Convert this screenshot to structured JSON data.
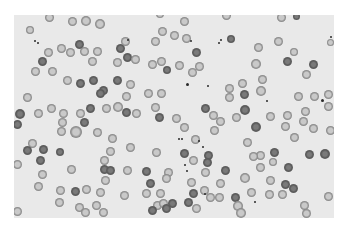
{
  "image": {
    "description": "Peripheral blood smear micrograph showing scattered red blood cells (erythrocytes) with central pallor, a few darker spherocyte-like cells and small dark platelet clumps",
    "background_color": "#ffffff",
    "smear_color": "#e9e9e9",
    "cell_ring_color": "#7d7d7d",
    "cell_center_color": "#c9c9c9",
    "dark_cell_color": "#5a5a5a"
  },
  "cells": [
    [
      49,
      17,
      9,
      0
    ],
    [
      72,
      21,
      9,
      0
    ],
    [
      86,
      21,
      10,
      0
    ],
    [
      100,
      24,
      10,
      0
    ],
    [
      160,
      14,
      8,
      0
    ],
    [
      184,
      21,
      9,
      0
    ],
    [
      226,
      15,
      9,
      0
    ],
    [
      281,
      17,
      9,
      0
    ],
    [
      296,
      16,
      7,
      1
    ],
    [
      30,
      30,
      8,
      0
    ],
    [
      162,
      31,
      9,
      0
    ],
    [
      174,
      35,
      9,
      0
    ],
    [
      186,
      38,
      9,
      0
    ],
    [
      231,
      39,
      8,
      1
    ],
    [
      278,
      41,
      9,
      0
    ],
    [
      330,
      42,
      7,
      0
    ],
    [
      48,
      52,
      9,
      0
    ],
    [
      61,
      48,
      9,
      0
    ],
    [
      70,
      52,
      9,
      0
    ],
    [
      79,
      44,
      9,
      1
    ],
    [
      84,
      51,
      9,
      0
    ],
    [
      97,
      51,
      9,
      0
    ],
    [
      120,
      48,
      9,
      1
    ],
    [
      125,
      41,
      9,
      0
    ],
    [
      155,
      41,
      9,
      0
    ],
    [
      196,
      52,
      9,
      1
    ],
    [
      258,
      47,
      9,
      0
    ],
    [
      294,
      52,
      8,
      0
    ],
    [
      42,
      61,
      9,
      1
    ],
    [
      92,
      61,
      9,
      0
    ],
    [
      117,
      62,
      9,
      0
    ],
    [
      127,
      57,
      9,
      1
    ],
    [
      135,
      59,
      9,
      0
    ],
    [
      152,
      64,
      9,
      0
    ],
    [
      161,
      61,
      9,
      0
    ],
    [
      167,
      70,
      8,
      1
    ],
    [
      179,
      65,
      9,
      0
    ],
    [
      192,
      72,
      9,
      0
    ],
    [
      199,
      66,
      9,
      0
    ],
    [
      256,
      64,
      10,
      0
    ],
    [
      287,
      61,
      9,
      1
    ],
    [
      313,
      64,
      9,
      1
    ],
    [
      35,
      71,
      9,
      0
    ],
    [
      52,
      71,
      9,
      0
    ],
    [
      67,
      80,
      9,
      0
    ],
    [
      80,
      83,
      9,
      1
    ],
    [
      93,
      80,
      9,
      1
    ],
    [
      103,
      90,
      9,
      1
    ],
    [
      117,
      80,
      9,
      1
    ],
    [
      130,
      84,
      9,
      0
    ],
    [
      262,
      79,
      9,
      0
    ],
    [
      306,
      74,
      9,
      0
    ],
    [
      229,
      88,
      9,
      0
    ],
    [
      242,
      83,
      9,
      0
    ],
    [
      27,
      97,
      9,
      0
    ],
    [
      100,
      93,
      9,
      1
    ],
    [
      126,
      96,
      9,
      0
    ],
    [
      148,
      93,
      9,
      0
    ],
    [
      161,
      93,
      9,
      0
    ],
    [
      229,
      97,
      9,
      0
    ],
    [
      244,
      94,
      9,
      1
    ],
    [
      261,
      91,
      10,
      0
    ],
    [
      298,
      96,
      9,
      0
    ],
    [
      314,
      96,
      9,
      0
    ],
    [
      328,
      94,
      9,
      0
    ],
    [
      20,
      114,
      10,
      1
    ],
    [
      38,
      113,
      9,
      0
    ],
    [
      51,
      108,
      9,
      0
    ],
    [
      63,
      113,
      9,
      0
    ],
    [
      80,
      113,
      9,
      0
    ],
    [
      90,
      108,
      9,
      1
    ],
    [
      106,
      108,
      9,
      0
    ],
    [
      118,
      107,
      10,
      0
    ],
    [
      126,
      112,
      9,
      1
    ],
    [
      136,
      113,
      9,
      0
    ],
    [
      155,
      107,
      9,
      0
    ],
    [
      205,
      108,
      9,
      1
    ],
    [
      213,
      115,
      9,
      0
    ],
    [
      245,
      110,
      10,
      1
    ],
    [
      270,
      116,
      9,
      0
    ],
    [
      287,
      115,
      9,
      0
    ],
    [
      305,
      111,
      9,
      0
    ],
    [
      328,
      106,
      9,
      0
    ],
    [
      17,
      124,
      9,
      1
    ],
    [
      62,
      122,
      9,
      0
    ],
    [
      84,
      122,
      9,
      1
    ],
    [
      159,
      117,
      9,
      1
    ],
    [
      176,
      118,
      9,
      0
    ],
    [
      220,
      121,
      9,
      0
    ],
    [
      236,
      117,
      9,
      0
    ],
    [
      256,
      127,
      10,
      1
    ],
    [
      285,
      126,
      9,
      0
    ],
    [
      303,
      121,
      9,
      0
    ],
    [
      313,
      128,
      9,
      0
    ],
    [
      61,
      131,
      9,
      0
    ],
    [
      76,
      132,
      12,
      0
    ],
    [
      97,
      132,
      9,
      0
    ],
    [
      184,
      127,
      9,
      0
    ],
    [
      214,
      130,
      9,
      0
    ],
    [
      330,
      130,
      9,
      0
    ],
    [
      32,
      143,
      9,
      0
    ],
    [
      112,
      138,
      9,
      0
    ],
    [
      195,
      139,
      9,
      0
    ],
    [
      247,
      142,
      9,
      0
    ],
    [
      294,
      137,
      9,
      0
    ],
    [
      27,
      150,
      9,
      1
    ],
    [
      43,
      149,
      9,
      1
    ],
    [
      60,
      152,
      8,
      1
    ],
    [
      110,
      151,
      9,
      0
    ],
    [
      130,
      147,
      9,
      0
    ],
    [
      156,
      152,
      9,
      0
    ],
    [
      184,
      153,
      9,
      1
    ],
    [
      208,
      155,
      9,
      1
    ],
    [
      260,
      155,
      9,
      0
    ],
    [
      274,
      152,
      9,
      1
    ],
    [
      309,
      154,
      9,
      1
    ],
    [
      325,
      154,
      10,
      1
    ],
    [
      40,
      160,
      9,
      1
    ],
    [
      104,
      160,
      9,
      0
    ],
    [
      193,
      160,
      9,
      0
    ],
    [
      207,
      162,
      9,
      1
    ],
    [
      253,
      156,
      9,
      0
    ],
    [
      273,
      162,
      8,
      0
    ],
    [
      17,
      164,
      9,
      0
    ],
    [
      71,
      169,
      9,
      0
    ],
    [
      104,
      169,
      9,
      1
    ],
    [
      110,
      170,
      9,
      1
    ],
    [
      127,
      170,
      9,
      0
    ],
    [
      146,
      171,
      9,
      1
    ],
    [
      168,
      172,
      9,
      0
    ],
    [
      205,
      172,
      9,
      0
    ],
    [
      225,
      170,
      9,
      1
    ],
    [
      260,
      167,
      9,
      0
    ],
    [
      288,
      167,
      9,
      1
    ],
    [
      42,
      174,
      9,
      0
    ],
    [
      105,
      180,
      9,
      0
    ],
    [
      150,
      183,
      9,
      1
    ],
    [
      166,
      178,
      9,
      0
    ],
    [
      191,
      182,
      9,
      0
    ],
    [
      220,
      183,
      9,
      0
    ],
    [
      245,
      178,
      10,
      0
    ],
    [
      270,
      180,
      9,
      0
    ],
    [
      285,
      184,
      9,
      1
    ],
    [
      293,
      188,
      9,
      1
    ],
    [
      38,
      186,
      9,
      0
    ],
    [
      60,
      190,
      9,
      0
    ],
    [
      75,
      191,
      9,
      1
    ],
    [
      86,
      189,
      9,
      0
    ],
    [
      100,
      192,
      9,
      0
    ],
    [
      124,
      195,
      9,
      0
    ],
    [
      146,
      193,
      9,
      0
    ],
    [
      160,
      193,
      9,
      0
    ],
    [
      193,
      193,
      9,
      1
    ],
    [
      204,
      190,
      9,
      0
    ],
    [
      210,
      197,
      9,
      0
    ],
    [
      219,
      197,
      9,
      0
    ],
    [
      235,
      197,
      9,
      1
    ],
    [
      251,
      192,
      9,
      0
    ],
    [
      269,
      194,
      9,
      0
    ],
    [
      282,
      194,
      9,
      0
    ],
    [
      328,
      196,
      9,
      0
    ],
    [
      59,
      202,
      9,
      0
    ],
    [
      79,
      207,
      9,
      0
    ],
    [
      96,
      205,
      9,
      0
    ],
    [
      157,
      205,
      9,
      0
    ],
    [
      163,
      203,
      9,
      0
    ],
    [
      172,
      203,
      9,
      1
    ],
    [
      188,
      202,
      9,
      1
    ],
    [
      238,
      206,
      10,
      0
    ],
    [
      304,
      205,
      9,
      0
    ],
    [
      17,
      211,
      9,
      0
    ],
    [
      85,
      212,
      9,
      0
    ],
    [
      103,
      212,
      9,
      0
    ],
    [
      152,
      210,
      9,
      1
    ],
    [
      166,
      208,
      9,
      1
    ],
    [
      196,
      208,
      9,
      0
    ],
    [
      241,
      213,
      10,
      0
    ],
    [
      306,
      213,
      9,
      0
    ]
  ],
  "dots": [
    [
      35,
      41,
      2
    ],
    [
      38,
      43,
      2
    ],
    [
      128,
      40,
      2
    ],
    [
      191,
      41,
      2
    ],
    [
      219,
      43,
      2
    ],
    [
      221,
      40,
      2
    ],
    [
      187,
      84,
      3
    ],
    [
      208,
      86,
      2
    ],
    [
      267,
      101,
      2
    ],
    [
      322,
      100,
      3
    ],
    [
      179,
      139,
      2
    ],
    [
      182,
      139,
      2
    ],
    [
      199,
      141,
      2
    ],
    [
      203,
      147,
      2
    ],
    [
      185,
      165,
      2
    ],
    [
      187,
      171,
      2
    ],
    [
      205,
      194,
      2
    ],
    [
      255,
      202,
      2
    ],
    [
      331,
      37,
      2
    ]
  ]
}
